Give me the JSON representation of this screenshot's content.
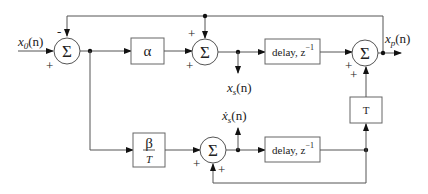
{
  "diagram": {
    "type": "block-diagram",
    "inputs": {
      "x0": {
        "label": "x",
        "sub": "0",
        "arg": "(n)"
      }
    },
    "outputs": {
      "xp": {
        "label": "x",
        "sub": "p",
        "arg": "(n)"
      },
      "xs": {
        "label": "x",
        "sub": "s",
        "arg": "(n)"
      },
      "xs_dot": {
        "label": "ẋ",
        "sub": "s",
        "arg": "(n)"
      }
    },
    "summers": {
      "sum1": {
        "symbol": "Σ",
        "signs": {
          "top": "-",
          "left": "+"
        }
      },
      "sum2": {
        "symbol": "Σ",
        "signs": {
          "top": "+",
          "left": "+"
        }
      },
      "sum3": {
        "symbol": "Σ",
        "signs": {
          "left": "+",
          "bottom": "+"
        }
      },
      "sum4": {
        "symbol": "Σ",
        "signs": {
          "left": "+",
          "bottom": "+"
        }
      }
    },
    "blocks": {
      "alpha": {
        "label": "α"
      },
      "beta": {
        "num": "β",
        "den": "T"
      },
      "delay1": {
        "label": "delay, z",
        "exp": "−1"
      },
      "delay2": {
        "label": "delay, z",
        "exp": "−1"
      },
      "T": {
        "label": "T"
      }
    }
  }
}
